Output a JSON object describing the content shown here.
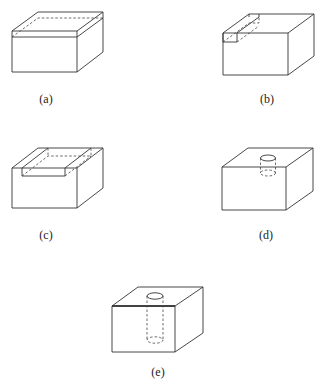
{
  "figures": [
    {
      "id": "a",
      "label": "(a)",
      "description": "Box with a thin horizontal slab removed across the full top"
    },
    {
      "id": "b",
      "label": "(b)",
      "description": "Box with a narrow rectangular slot along the left top edge"
    },
    {
      "id": "c",
      "label": "(c)",
      "description": "Box with a wide rectangular channel cut across the top"
    },
    {
      "id": "d",
      "label": "(d)",
      "description": "Box with a shallow cylindrical hole in the top"
    },
    {
      "id": "e",
      "label": "(e)",
      "description": "Box with a deep cylindrical hole in the top"
    }
  ],
  "colors": {
    "line": "#333333",
    "background": "#ffffff"
  }
}
